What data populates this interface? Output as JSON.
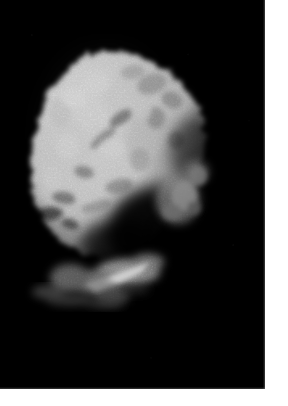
{
  "image": {
    "kind": "spacecraft-grayscale-photograph",
    "subject_label": "comet nucleus",
    "alt_text": "Grayscale spacecraft image of an irregular comet nucleus lit from the upper left against the black of space",
    "width_px": 288,
    "height_px": 406,
    "frame": {
      "left_px": 0,
      "top_px": 0,
      "width_px": 265,
      "height_px": 389,
      "background_color": "#000000"
    },
    "margins": {
      "right_px": 23,
      "bottom_px": 17,
      "color": "#ffffff"
    },
    "palette": {
      "space_black": "#000000",
      "terminator_shadow": "#0a0a0a",
      "dark_gray": "#4a4a4a",
      "mid_gray": "#8d8d8d",
      "light_gray": "#c4c4c4",
      "highlight_white": "#f2f2f2",
      "page_white": "#ffffff"
    },
    "lighting": {
      "illumination_direction": "upper-left",
      "terminator_description": "diagonal terminator running from lower-left to mid-right"
    },
    "body": {
      "bounding_box": {
        "x": 30,
        "y": 50,
        "width": 180,
        "height": 262
      },
      "outline_points": "95,52 118,52 142,57 163,66 180,79 193,95 201,112 205,131 203,150 196,168 186,183 176,196 168,210 160,222 150,232 138,240 124,246 110,250 96,252 82,250 68,244 56,234 46,221 39,205 34,188 32,170 33,151 37,132 44,113 54,95 67,79 80,64",
      "features": [
        {
          "name": "bright-limb-ridge",
          "cx": 78,
          "cy": 105,
          "rx": 34,
          "ry": 40,
          "tone": "#ededed"
        },
        {
          "name": "upper-crater-cluster",
          "cx": 150,
          "cy": 88,
          "rx": 26,
          "ry": 20,
          "tone": "#9a9a9a"
        },
        {
          "name": "central-bright-plateau",
          "cx": 100,
          "cy": 150,
          "rx": 44,
          "ry": 40,
          "tone": "#e4e4e4"
        },
        {
          "name": "dark-pit-left",
          "cx": 48,
          "cy": 214,
          "rx": 13,
          "ry": 7,
          "tone": "#101010"
        },
        {
          "name": "dark-pit-center",
          "cx": 120,
          "cy": 120,
          "rx": 10,
          "ry": 6,
          "tone": "#3a3a3a"
        },
        {
          "name": "right-rubble-patch",
          "cx": 178,
          "cy": 180,
          "rx": 20,
          "ry": 22,
          "tone": "#787878"
        },
        {
          "name": "lower-bright-spur",
          "cx": 128,
          "cy": 272,
          "rx": 26,
          "ry": 9,
          "tone": "#c9c9c9"
        },
        {
          "name": "terminator-shadow-zone",
          "cx": 150,
          "cy": 240,
          "rx": 52,
          "ry": 46,
          "tone": "#050505"
        }
      ]
    }
  }
}
